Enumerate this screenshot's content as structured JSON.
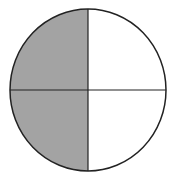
{
  "diagram": {
    "type": "fraction-circle",
    "parts": 4,
    "shaded_parts": 2,
    "shaded_quadrants": [
      "top-left",
      "bottom-left"
    ],
    "unshaded_quadrants": [
      "top-right",
      "bottom-right"
    ],
    "fraction_shaded": "2/4",
    "colors": {
      "shade": "#a3a3a3",
      "stroke": "#222222",
      "background": "#ffffff"
    }
  }
}
